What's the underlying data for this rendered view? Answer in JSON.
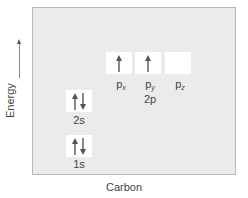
{
  "axes": {
    "y_label": "Energy",
    "x_label": "Carbon"
  },
  "colors": {
    "panel_bg": "#ebebeb",
    "box_bg": "#ffffff",
    "arrow": "#555555"
  },
  "orbitals": {
    "s1": {
      "label": "1s",
      "electrons": [
        "up",
        "down"
      ]
    },
    "s2": {
      "label": "2s",
      "electrons": [
        "up",
        "down"
      ]
    },
    "p2": {
      "group_label": "2p",
      "px": {
        "label": "p",
        "sub": "x",
        "electrons": [
          "up"
        ]
      },
      "py": {
        "label": "p",
        "sub": "y",
        "electrons": [
          "up"
        ]
      },
      "pz": {
        "label": "p",
        "sub": "z",
        "electrons": []
      }
    }
  }
}
